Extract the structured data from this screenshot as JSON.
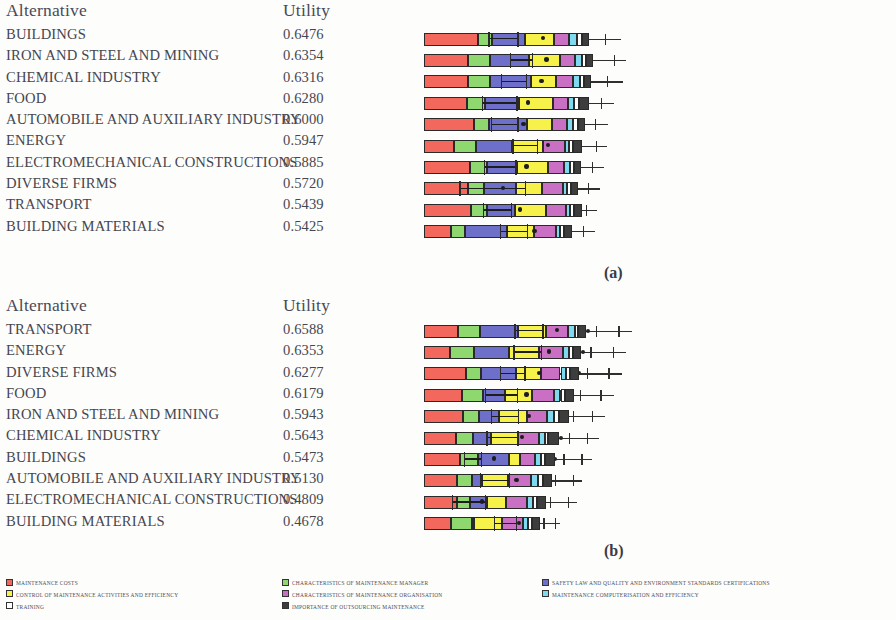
{
  "colors": {
    "maintenance_costs": "#f2685c",
    "control_of_maintenance": "#f7f24a",
    "training": "#ffffff",
    "char_manager": "#8ed86f",
    "char_organisation": "#c96fc4",
    "outsourcing": "#3d3d3d",
    "safety_law": "#6d6fc9",
    "computerisation": "#7fd9ef",
    "outline": "#2a2a2a"
  },
  "panel_a": {
    "label": "(a)",
    "columns": {
      "alternative": "Alternative",
      "utility": "Utility"
    },
    "rows": [
      {
        "alternative": "BUILDINGS",
        "utility": "0.6476"
      },
      {
        "alternative": "IRON AND STEEL AND MINING",
        "utility": "0.6354"
      },
      {
        "alternative": "CHEMICAL INDUSTRY",
        "utility": "0.6316"
      },
      {
        "alternative": "FOOD",
        "utility": "0.6280"
      },
      {
        "alternative": "AUTOMOBILE AND AUXILIARY INDUSTRY",
        "utility": "0.6000"
      },
      {
        "alternative": "ENERGY",
        "utility": "0.5947"
      },
      {
        "alternative": "ELECTROMECHANICAL CONSTRUCTIONS",
        "utility": "0.5885"
      },
      {
        "alternative": "DIVERSE FIRMS",
        "utility": "0.5720"
      },
      {
        "alternative": "TRANSPORT",
        "utility": "0.5439"
      },
      {
        "alternative": "BUILDING MATERIALS",
        "utility": "0.5425"
      }
    ]
  },
  "panel_b": {
    "label": "(b)",
    "columns": {
      "alternative": "Alternative",
      "utility": "Utility"
    },
    "rows": [
      {
        "alternative": "TRANSPORT",
        "utility": "0.6588"
      },
      {
        "alternative": "ENERGY",
        "utility": "0.6353"
      },
      {
        "alternative": "DIVERSE FIRMS",
        "utility": "0.6277"
      },
      {
        "alternative": "FOOD",
        "utility": "0.6179"
      },
      {
        "alternative": "IRON AND STEEL AND MINING",
        "utility": "0.5943"
      },
      {
        "alternative": "CHEMICAL INDUSTRY",
        "utility": "0.5643"
      },
      {
        "alternative": "BUILDINGS",
        "utility": "0.5473"
      },
      {
        "alternative": "AUTOMOBILE AND AUXILIARY INDUSTRY",
        "utility": "0.5130"
      },
      {
        "alternative": "ELECTROMECHANICAL CONSTRUCTIONS",
        "utility": "0.4809"
      },
      {
        "alternative": "BUILDING MATERIALS",
        "utility": "0.4678"
      }
    ]
  },
  "legend": {
    "columns": [
      [
        {
          "label": "MAINTENANCE COSTS",
          "color": "#f2685c"
        },
        {
          "label": "CONTROL OF MAINTENANCE ACTIVITIES AND EFFICIENCY",
          "color": "#f7f24a"
        },
        {
          "label": "TRAINING",
          "color": "#ffffff"
        }
      ],
      [
        {
          "label": "CHARACTERISTICS OF MAINTENANCE MANAGER",
          "color": "#8ed86f"
        },
        {
          "label": "CHARACTERISTICS OF MAINTENANCE ORGANISATION",
          "color": "#c96fc4"
        },
        {
          "label": "IMPORTANCE OF OUTSOURCING MAINTENANCE",
          "color": "#3d3d3d"
        }
      ],
      [
        {
          "label": "SAFETY LAW AND QUALITY AND ENVIRONMENT STANDARDS CERTIFICATIONS",
          "color": "#6d6fc9"
        },
        {
          "label": "MAINTENANCE COMPUTERISATION AND EFFICIENCY",
          "color": "#7fd9ef"
        }
      ]
    ]
  },
  "chart_data": {
    "type": "bar",
    "title": "",
    "subtype": "stacked-horizontal",
    "series": [
      {
        "name": "MAINTENANCE COSTS",
        "color": "#f2685c"
      },
      {
        "name": "CHARACTERISTICS OF MAINTENANCE MANAGER",
        "color": "#8ed86f"
      },
      {
        "name": "SAFETY LAW AND QUALITY AND ENVIRONMENT STANDARDS CERTIFICATIONS",
        "color": "#6d6fc9"
      },
      {
        "name": "CONTROL OF MAINTENANCE ACTIVITIES AND EFFICIENCY",
        "color": "#f7f24a"
      },
      {
        "name": "CHARACTERISTICS OF MAINTENANCE ORGANISATION",
        "color": "#c96fc4"
      },
      {
        "name": "MAINTENANCE COMPUTERISATION AND EFFICIENCY",
        "color": "#7fd9ef"
      },
      {
        "name": "TRAINING",
        "color": "#ffffff"
      },
      {
        "name": "IMPORTANCE OF OUTSOURCING MAINTENANCE",
        "color": "#3d3d3d"
      }
    ],
    "panels": [
      {
        "id": "a",
        "categories": [
          "BUILDINGS",
          "IRON AND STEEL AND MINING",
          "CHEMICAL INDUSTRY",
          "FOOD",
          "AUTOMOBILE AND AUXILIARY INDUSTRY",
          "ENERGY",
          "ELECTROMECHANICAL CONSTRUCTIONS",
          "DIVERSE FIRMS",
          "TRANSPORT",
          "BUILDING MATERIALS"
        ],
        "totals": [
          0.6476,
          0.6354,
          0.6316,
          0.628,
          0.6,
          0.5947,
          0.5885,
          0.572,
          0.5439,
          0.5425
        ],
        "bars": [
          {
            "segments": [
              120,
              31,
              72,
              64,
              34,
              18,
              10,
              16
            ],
            "whisker_to": 435,
            "inner_line": [
              142,
              64
            ],
            "inner_dot": 258,
            "ticks": [
              305,
              330,
              400
            ],
            "dots": [
              355
            ]
          },
          {
            "segments": [
              98,
              48,
              86,
              68,
              35,
              14,
              10,
              15
            ],
            "whisker_to": 448,
            "inner_line": [
              190,
              48
            ],
            "inner_dot": 266,
            "ticks": [
              312,
              360,
              420
            ],
            "dots": [
              340
            ]
          },
          {
            "segments": [
              98,
              47,
              91,
              57,
              36,
              16,
              9,
              16
            ],
            "whisker_to": 440,
            "inner_line": [
              170,
              55
            ],
            "inner_dot": 255,
            "ticks": [
              305,
              352,
              405
            ],
            "dots": [
              330
            ]
          },
          {
            "segments": [
              96,
              39,
              76,
              74,
              34,
              13,
              11,
              21
            ],
            "whisker_to": 420,
            "inner_line": [
              128,
              76
            ],
            "inner_dot": 225,
            "ticks": [
              300,
              345,
              392
            ],
            "dots": [
              318
            ]
          },
          {
            "segments": [
              110,
              33,
              84,
              57,
              32,
              14,
              11,
              16
            ],
            "whisker_to": 408,
            "inner_line": [
              148,
              58
            ],
            "inner_dot": 215,
            "ticks": [
              295,
              336,
              378
            ],
            "dots": [
              312
            ]
          },
          {
            "segments": [
              67,
              49,
              79,
              69,
              49,
              7,
              9,
              20
            ],
            "whisker_to": 405,
            "inner_line": [
              195,
              55
            ],
            "inner_dot": 270,
            "ticks": [
              298,
              338,
              380
            ],
            "dots": [
              316
            ]
          },
          {
            "segments": [
              102,
              37,
              66,
              69,
              36,
              13,
              9,
              16
            ],
            "whisker_to": 398,
            "inner_line": [
              132,
              70
            ],
            "inner_dot": 222,
            "ticks": [
              288,
              330,
              372
            ],
            "dots": [
              305
            ]
          },
          {
            "segments": [
              97,
              36,
              70,
              57,
              47,
              9,
              10,
              15
            ],
            "whisker_to": 390,
            "inner_line": [
              78,
              145
            ],
            "inner_dot": 170,
            "ticks": [
              282,
              322,
              362
            ],
            "dots": [
              298
            ]
          },
          {
            "segments": [
              103,
              36,
              63,
              68,
              45,
              7,
              9,
              18
            ],
            "whisker_to": 382,
            "inner_line": [
              130,
              62
            ],
            "inner_dot": 208,
            "ticks": [
              278,
              318,
              358
            ],
            "dots": [
              295
            ]
          },
          {
            "segments": [
              60,
              30,
              93,
              60,
              50,
              7,
              9,
              18
            ],
            "whisker_to": 378,
            "inner_line": [
              168,
              60
            ],
            "inner_dot": 240,
            "ticks": [
              272,
              312,
              352
            ],
            "dots": [
              288
            ]
          }
        ]
      },
      {
        "id": "b",
        "categories": [
          "TRANSPORT",
          "ENERGY",
          "DIVERSE FIRMS",
          "FOOD",
          "IRON AND STEEL AND MINING",
          "CHEMICAL INDUSTRY",
          "BUILDINGS",
          "AUTOMOBILE AND AUXILIARY INDUSTRY",
          "ELECTROMECHANICAL CONSTRUCTIONS",
          "BUILDING MATERIALS"
        ],
        "totals": [
          0.6588,
          0.6353,
          0.6277,
          0.6179,
          0.5943,
          0.5643,
          0.5473,
          0.513,
          0.4809,
          0.4678
        ],
        "bars": [
          {
            "segments": [
              75,
              48,
              85,
              63,
              48,
              14,
              8,
              17
            ],
            "whisker_to": 460,
            "inner_line": [
              200,
              62
            ],
            "inner_dot": 290,
            "ticks": [
              330,
              380,
              430
            ],
            "dots": [
              358
            ]
          },
          {
            "segments": [
              58,
              52,
              78,
              67,
              52,
              14,
              9,
              18
            ],
            "whisker_to": 448,
            "inner_line": [
              198,
              60
            ],
            "inner_dot": 272,
            "ticks": [
              320,
              368,
              418
            ],
            "dots": [
              348
            ]
          },
          {
            "segments": [
              94,
              33,
              76,
              56,
              43,
              13,
              9,
              18
            ],
            "whisker_to": 438,
            "inner_line": [
              168,
              54
            ],
            "inner_dot": 250,
            "ticks": [
              312,
              360,
              408
            ],
            "dots": [
              338
            ]
          },
          {
            "segments": [
              85,
              46,
              49,
              60,
              48,
              14,
              10,
              20
            ],
            "whisker_to": 420,
            "inner_line": [
              135,
              70
            ],
            "inner_dot": 222,
            "ticks": [
              300,
              345,
              390
            ],
            "dots": [
              322
            ]
          },
          {
            "segments": [
              86,
              36,
              44,
              62,
              45,
              14,
              12,
              22
            ],
            "whisker_to": 400,
            "inner_line": [
              148,
              60
            ],
            "inner_dot": 228,
            "ticks": [
              288,
              330,
              372
            ],
            "dots": [
              308
            ]
          },
          {
            "segments": [
              70,
              38,
              40,
              60,
              46,
              13,
              8,
              23
            ],
            "whisker_to": 388,
            "inner_line": [
              138,
              68
            ],
            "inner_dot": 212,
            "ticks": [
              278,
              320,
              360
            ],
            "dots": [
              298
            ]
          },
          {
            "segments": [
              80,
              40,
              68,
              25,
              33,
              12,
              10,
              22
            ],
            "whisker_to": 372,
            "inner_line": [
              88,
              38
            ],
            "inner_dot": 150,
            "ticks": [
              268,
              308,
              348
            ],
            "dots": [
              286
            ]
          },
          {
            "segments": [
              73,
              34,
              22,
              57,
              50,
              16,
              11,
              20
            ],
            "whisker_to": 350,
            "inner_line": [
              123,
              64
            ],
            "inner_dot": 200,
            "ticks": [
              250,
              290,
              330
            ],
            "dots": [
              268
            ]
          },
          {
            "segments": [
              72,
              30,
              38,
              42,
              45,
              14,
              10,
              18
            ],
            "whisker_to": 338,
            "inner_line": [
              62,
              72
            ],
            "inner_dot": 124,
            "ticks": [
              240,
              278,
              318
            ],
            "dots": [
              258
            ]
          },
          {
            "segments": [
              60,
              47,
              4,
              62,
              45,
              12,
              9,
              17
            ],
            "whisker_to": 300,
            "inner_line": [
              155,
              48
            ],
            "inner_dot": 205,
            "ticks": [
              232,
              264,
              290
            ],
            "dots": [
              248
            ]
          }
        ]
      }
    ]
  }
}
